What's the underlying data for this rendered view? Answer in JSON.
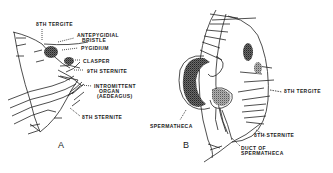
{
  "figure": {
    "panels": [
      {
        "id": "A",
        "label": "A",
        "labels": {
          "tergite8": "8TH TERGITE",
          "antepygidial_1": "ANTEPYGIDIAL",
          "antepygidial_2": "BRISTLE",
          "pygidium": "PYGIDIUM",
          "clasper": "CLASPER",
          "sternite9": "9TH STERNITE",
          "intromittent_1": "INTROMITTENT",
          "intromittent_2": "ORGAN",
          "intromittent_3": "(AEDEAGUS)",
          "sternite8": "8TH STERNITE"
        }
      },
      {
        "id": "B",
        "label": "B",
        "labels": {
          "spermatheca": "SPERMATHECA",
          "tergite8": "8TH TERGITE",
          "sternite8": "8TH STERNITE",
          "duct_1": "DUCT OF",
          "duct_2": "SPERMATHECA"
        }
      }
    ],
    "colors": {
      "ink": "#222222",
      "stipple": "#555555",
      "background": "#ffffff"
    }
  }
}
